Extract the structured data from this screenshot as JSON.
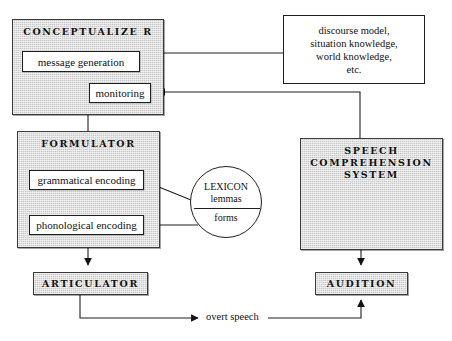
{
  "diagram": {
    "colors": {
      "module_fill": "#c9c9c9",
      "stroke": "#1f1f1f",
      "plain_fill": "#ffffff"
    }
  },
  "nodes": {
    "conceptualizer": {
      "label": "CONCEPTUALIZE R"
    },
    "message_generation": {
      "label": "message generation"
    },
    "monitoring": {
      "label": "monitoring"
    },
    "knowledge": {
      "label": "discourse model,\nsituation knowledge,\nworld knowledge,\netc."
    },
    "formulator": {
      "label": "FORMULATOR"
    },
    "grammatical_encoding": {
      "label": "grammatical encoding"
    },
    "phonological_encoding": {
      "label": "phonological encoding"
    },
    "lexicon": {
      "top_label": "LEXICON\nlemmas",
      "bottom_label": "forms"
    },
    "speech_comprehension_system": {
      "label": "SPEECH\nCOMPREHENSION\nSYSTEM"
    },
    "articulator": {
      "label": "ARTICULATOR"
    },
    "audition": {
      "label": "AUDITION"
    }
  },
  "edges": {
    "overt_speech": {
      "label": "overt speech"
    }
  }
}
